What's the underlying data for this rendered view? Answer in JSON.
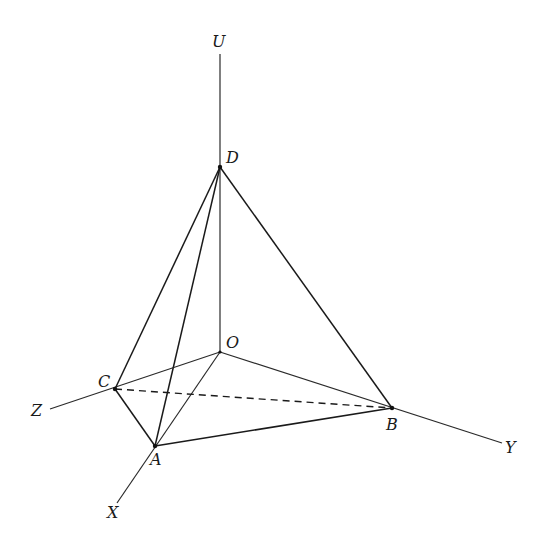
{
  "diagram": {
    "type": "3d-tetrahedron-on-axes",
    "colors": {
      "line": "#1a1a1a",
      "background": "#ffffff"
    },
    "axes": {
      "U": {
        "label": "U"
      },
      "X": {
        "label": "X"
      },
      "Y": {
        "label": "Y"
      },
      "Z": {
        "label": "Z"
      }
    },
    "points": {
      "O": {
        "label": "O"
      },
      "A": {
        "label": "A"
      },
      "B": {
        "label": "B"
      },
      "C": {
        "label": "C"
      },
      "D": {
        "label": "D"
      }
    },
    "solid_edges": [
      "DC",
      "DA",
      "DB",
      "CA",
      "AB",
      "OA",
      "OB",
      "OC",
      "OD"
    ],
    "dashed_edges": [
      "CB"
    ]
  }
}
